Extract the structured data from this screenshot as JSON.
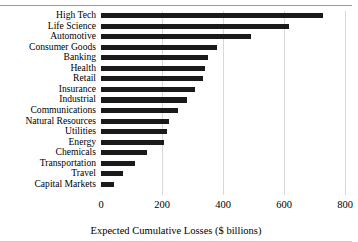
{
  "chart_data": {
    "type": "bar",
    "orientation": "horizontal",
    "title": "",
    "xlabel": "Expected Cumulative Losses ($ billions)",
    "ylabel": "",
    "xlim": [
      0,
      800
    ],
    "xticks": [
      0,
      200,
      400,
      600,
      800
    ],
    "grid": "vertical",
    "legend": "none",
    "bar_color": "#1a1a1a",
    "categories": [
      "High Tech",
      "Life Science",
      "Automotive",
      "Consumer Goods",
      "Banking",
      "Health",
      "Retail",
      "Insurance",
      "Industrial",
      "Communications",
      "Natural Resources",
      "Utilities",
      "Energy",
      "Chemicals",
      "Transportation",
      "Travel",
      "Capital Markets"
    ],
    "values": [
      728,
      618,
      492,
      381,
      350,
      340,
      335,
      308,
      283,
      254,
      224,
      216,
      207,
      150,
      111,
      72,
      43
    ]
  },
  "axis": {
    "title": "Expected Cumulative Losses ($ billions)",
    "tick_labels": [
      "0",
      "200",
      "400",
      "600",
      "800"
    ]
  }
}
